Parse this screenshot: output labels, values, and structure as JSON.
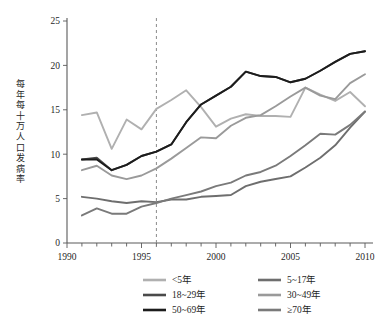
{
  "chart_data": {
    "type": "line",
    "title": "",
    "xlabel": "",
    "ylabel": "每年每十万人口发病率",
    "xlim": [
      1990,
      2010
    ],
    "ylim": [
      0,
      25
    ],
    "xticks": [
      1990,
      1995,
      2000,
      2005,
      2010
    ],
    "yticks": [
      0,
      5,
      10,
      15,
      20,
      25
    ],
    "minor_xticks_every": 1,
    "grid": false,
    "legend_position": "bottom",
    "annotations": [
      {
        "type": "vertical-dashed-line",
        "x": 1996,
        "label": ""
      }
    ],
    "x": [
      1991,
      1992,
      1993,
      1994,
      1995,
      1996,
      1997,
      1998,
      1999,
      2000,
      2001,
      2002,
      2003,
      2004,
      2005,
      2006,
      2007,
      2008,
      2009,
      2010
    ],
    "series": [
      {
        "name": "<5年",
        "color": "#b0b0b0",
        "values": [
          14.4,
          14.7,
          10.6,
          13.9,
          12.8,
          15.1,
          16.1,
          17.2,
          15.3,
          13.1,
          14.0,
          14.5,
          14.3,
          14.3,
          14.2,
          17.5,
          16.7,
          16.0,
          17.0,
          15.4
        ]
      },
      {
        "name": "5~17年",
        "color": "#6e6e6e",
        "values": [
          5.2,
          5.0,
          4.7,
          4.5,
          4.7,
          4.6,
          4.9,
          4.9,
          5.2,
          5.3,
          5.4,
          6.4,
          6.9,
          7.2,
          7.5,
          8.5,
          9.6,
          11.0,
          13.0,
          14.8
        ]
      },
      {
        "name": "18~29年",
        "color": "#4a4a4a",
        "values": [
          9.4,
          9.6,
          8.2,
          8.8,
          9.8,
          10.3,
          11.1,
          13.6,
          15.6,
          16.6,
          17.6,
          19.3,
          18.8,
          18.7,
          18.1,
          18.5,
          19.4,
          20.4,
          21.3,
          21.6
        ]
      },
      {
        "name": "30~49年",
        "color": "#9a9a9a",
        "values": [
          8.2,
          8.7,
          7.6,
          7.2,
          7.6,
          8.4,
          9.5,
          10.7,
          11.9,
          11.8,
          13.2,
          14.1,
          14.4,
          15.4,
          16.5,
          17.5,
          16.6,
          16.2,
          18.0,
          19.0
        ]
      },
      {
        "name": "50~69年",
        "color": "#1c1c1c",
        "values": [
          9.4,
          9.4,
          8.2,
          8.8,
          9.8,
          10.3,
          11.1,
          13.6,
          15.6,
          16.6,
          17.6,
          19.3,
          18.8,
          18.7,
          18.1,
          18.5,
          19.4,
          20.4,
          21.3,
          21.6
        ]
      },
      {
        "name": "≥70年",
        "color": "#7a7a7a",
        "values": [
          3.1,
          3.9,
          3.3,
          3.3,
          4.1,
          4.5,
          5.0,
          5.4,
          5.8,
          6.4,
          6.8,
          7.6,
          8.0,
          8.7,
          9.8,
          11.0,
          12.3,
          12.2,
          13.3,
          14.8
        ]
      }
    ],
    "legend_entries": [
      {
        "label": "<5年",
        "color": "#b0b0b0"
      },
      {
        "label": "5~17年",
        "color": "#6e6e6e"
      },
      {
        "label": "18~29年",
        "color": "#4a4a4a"
      },
      {
        "label": "30~49年",
        "color": "#9a9a9a"
      },
      {
        "label": "50~69年",
        "color": "#1c1c1c"
      },
      {
        "label": "≥70年",
        "color": "#7a7a7a"
      }
    ]
  }
}
